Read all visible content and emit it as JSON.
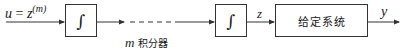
{
  "diagram": {
    "type": "block-diagram",
    "input_label": {
      "var": "u",
      "eq": " = ",
      "base": "z",
      "sup": "(m)"
    },
    "blocks": [
      {
        "id": "integrator-1",
        "symbol": "∫"
      },
      {
        "id": "integrator-m",
        "symbol": "∫"
      },
      {
        "id": "given-system",
        "label": "给定系统"
      }
    ],
    "chain_label": {
      "var": "m",
      "text": " 积分器"
    },
    "intermediate_label": "z",
    "output_label": "y",
    "colors": {
      "line": "#333333",
      "background": "#ffffff"
    }
  }
}
